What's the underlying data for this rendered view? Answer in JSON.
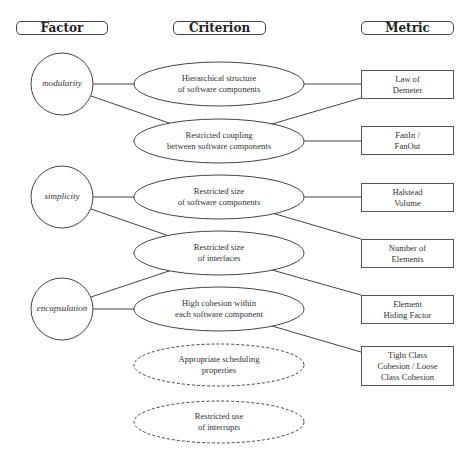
{
  "headers": {
    "factor": "Factor",
    "criterion": "Criterion",
    "metric": "Metric"
  },
  "factors": [
    {
      "label": "modularity"
    },
    {
      "label": "simplicity"
    },
    {
      "label": "encapsulation"
    }
  ],
  "criteria": [
    {
      "line1": "Hierarchical structure",
      "line2": "of software components",
      "style": "solid"
    },
    {
      "line1": "Restricted coupling",
      "line2": "between software components",
      "style": "solid"
    },
    {
      "line1": "Restricted size",
      "line2": "of software components",
      "style": "solid"
    },
    {
      "line1": "Restricted size",
      "line2": "of interfaces",
      "style": "solid"
    },
    {
      "line1": "High cohesion within",
      "line2": "each software component",
      "style": "solid"
    },
    {
      "line1": "Appropriate scheduling",
      "line2": "properties",
      "style": "dashed"
    },
    {
      "line1": "Restricted use",
      "line2": "of interrupts",
      "style": "dashed"
    }
  ],
  "metrics": [
    {
      "text": "Law of\nDemeter"
    },
    {
      "text": "FanIn /\nFanOut"
    },
    {
      "text": "Halstead\nVolume"
    },
    {
      "text": "Number of\nElements"
    },
    {
      "text": "Element\nHiding Factor"
    },
    {
      "text": "Tight Class\nCohesion / Loose\nClass Cohesion"
    }
  ],
  "edges": [
    {
      "from": "modularity",
      "to": "Hierarchical structure of software components"
    },
    {
      "from": "modularity",
      "to": "Restricted coupling between software components"
    },
    {
      "from": "simplicity",
      "to": "Restricted size of software components"
    },
    {
      "from": "simplicity",
      "to": "Restricted size of interfaces"
    },
    {
      "from": "encapsulation",
      "to": "Restricted size of interfaces"
    },
    {
      "from": "encapsulation",
      "to": "High cohesion within each software component"
    },
    {
      "from": "Hierarchical structure of software components",
      "to": "Law of Demeter"
    },
    {
      "from": "Restricted coupling between software components",
      "to": "Law of Demeter"
    },
    {
      "from": "Restricted coupling between software components",
      "to": "FanIn / FanOut"
    },
    {
      "from": "Restricted size of software components",
      "to": "Halstead Volume"
    },
    {
      "from": "Restricted size of software components",
      "to": "Number of Elements"
    },
    {
      "from": "Restricted size of interfaces",
      "to": "Element Hiding Factor"
    },
    {
      "from": "High cohesion within each software component",
      "to": "Tight Class Cohesion / Loose Class Cohesion"
    }
  ],
  "colors": {
    "stroke": "#444444",
    "background": "#ffffff"
  }
}
